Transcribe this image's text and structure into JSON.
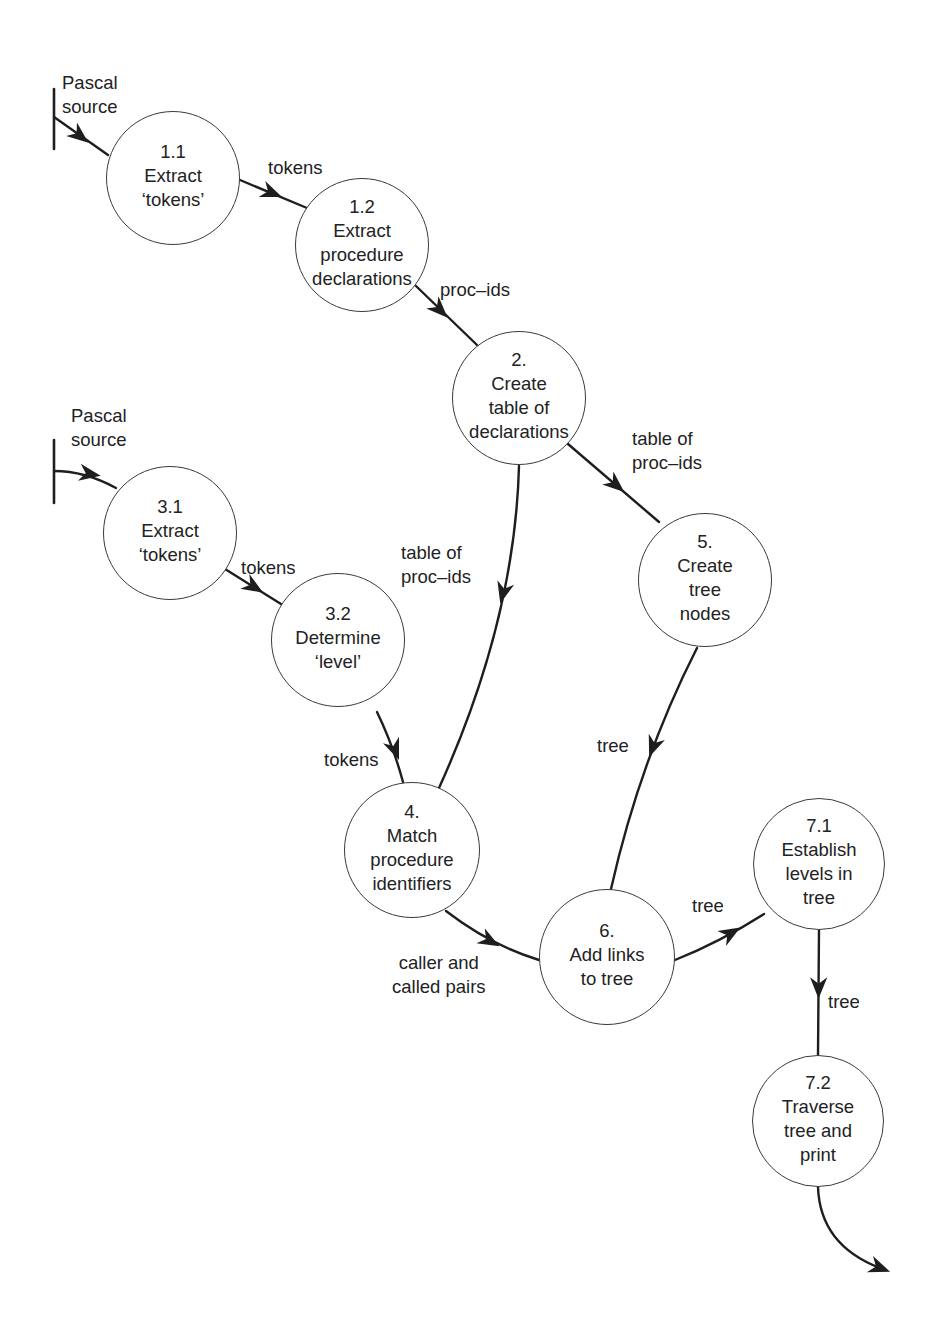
{
  "diagram": {
    "type": "data-flow-diagram",
    "processes": [
      {
        "id": "p11",
        "number": "1.1",
        "lines": [
          "Extract",
          "‘tokens’"
        ],
        "cx": 173,
        "cy": 178,
        "r": 67
      },
      {
        "id": "p12",
        "number": "1.2",
        "lines": [
          "Extract",
          "procedure",
          "declarations"
        ],
        "cx": 362,
        "cy": 245,
        "r": 67
      },
      {
        "id": "p2",
        "number": "2.",
        "lines": [
          "Create",
          "table of",
          "declarations"
        ],
        "cx": 519,
        "cy": 398,
        "r": 67
      },
      {
        "id": "p31",
        "number": "3.1",
        "lines": [
          "Extract",
          "‘tokens’"
        ],
        "cx": 170,
        "cy": 533,
        "r": 67
      },
      {
        "id": "p32",
        "number": "3.2",
        "lines": [
          "Determine",
          "‘level’"
        ],
        "cx": 338,
        "cy": 640,
        "r": 67
      },
      {
        "id": "p5",
        "number": "5.",
        "lines": [
          "Create",
          "tree",
          "nodes"
        ],
        "cx": 705,
        "cy": 580,
        "r": 67
      },
      {
        "id": "p4",
        "number": "4.",
        "lines": [
          "Match",
          "procedure",
          "identifiers"
        ],
        "cx": 412,
        "cy": 850,
        "r": 68
      },
      {
        "id": "p6",
        "number": "6.",
        "lines": [
          "Add links",
          "to tree"
        ],
        "cx": 607,
        "cy": 957,
        "r": 68
      },
      {
        "id": "p71",
        "number": "7.1",
        "lines": [
          "Establish",
          "levels in",
          "tree"
        ],
        "cx": 819,
        "cy": 864,
        "r": 66
      },
      {
        "id": "p72",
        "number": "7.2",
        "lines": [
          "Traverse",
          "tree and",
          "print"
        ],
        "cx": 818,
        "cy": 1121,
        "r": 66
      }
    ],
    "external_sources": [
      {
        "id": "src1",
        "label_lines": [
          "Pascal",
          "source"
        ],
        "label_x": 62,
        "label_y": 71
      },
      {
        "id": "src2",
        "label_lines": [
          "Pascal",
          "source"
        ],
        "label_x": 71,
        "label_y": 404
      }
    ],
    "flows": [
      {
        "from": "src1",
        "to": "p11",
        "label": ""
      },
      {
        "from": "p11",
        "to": "p12",
        "label": "tokens",
        "lx": 268,
        "ly": 156
      },
      {
        "from": "p12",
        "to": "p2",
        "label": "proc_ids",
        "lx": 440,
        "ly": 278
      },
      {
        "from": "p2",
        "to": "p5",
        "label_lines": [
          "table of",
          "proc_ids"
        ],
        "lx": 632,
        "ly": 427
      },
      {
        "from": "p2",
        "to": "p4",
        "label_lines": [
          "table of",
          "proc_ids"
        ],
        "lx": 401,
        "ly": 541
      },
      {
        "from": "src2",
        "to": "p31",
        "label": ""
      },
      {
        "from": "p31",
        "to": "p32",
        "label": "tokens",
        "lx": 241,
        "ly": 556
      },
      {
        "from": "p32",
        "to": "p4",
        "label": "tokens",
        "lx": 324,
        "ly": 748
      },
      {
        "from": "p5",
        "to": "p6",
        "label": "tree",
        "lx": 597,
        "ly": 734
      },
      {
        "from": "p4",
        "to": "p6",
        "label_lines": [
          "caller and",
          "called pairs"
        ],
        "lx": 387,
        "ly": 951
      },
      {
        "from": "p6",
        "to": "p71",
        "label": "tree",
        "lx": 692,
        "ly": 894
      },
      {
        "from": "p71",
        "to": "p72",
        "label": "tree",
        "lx": 828,
        "ly": 990
      },
      {
        "from": "p72",
        "to": "output",
        "label": ""
      }
    ],
    "labels": {
      "src1_l1": "Pascal",
      "src1_l2": "source",
      "src2_l1": "Pascal",
      "src2_l2": "source",
      "f_11_12": "tokens",
      "f_12_2": "proc–ids",
      "f_2_5_l1": "table of",
      "f_2_5_l2": "proc–ids",
      "f_2_4_l1": "table of",
      "f_2_4_l2": "proc–ids",
      "f_31_32": "tokens",
      "f_32_4": "tokens",
      "f_5_6": "tree",
      "f_4_6_l1": "caller and",
      "f_4_6_l2": "called pairs",
      "f_6_71": "tree",
      "f_71_72": "tree"
    },
    "colors": {
      "stroke": "#2a2a2a",
      "circle": "#3a3a3a",
      "text": "#222222",
      "background": "#ffffff"
    }
  }
}
